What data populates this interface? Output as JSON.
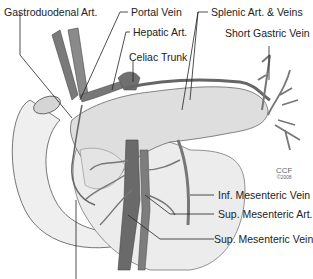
{
  "diagram": {
    "type": "anatomical-illustration",
    "labels": [
      {
        "id": "gastroduodenal-art",
        "text": "Gastroduodenal Art."
      },
      {
        "id": "portal-vein",
        "text": "Portal Vein"
      },
      {
        "id": "hepatic-art",
        "text": "Hepatic Art."
      },
      {
        "id": "celiac-trunk",
        "text": "Celiac Trunk"
      },
      {
        "id": "splenic-art-veins",
        "text": "Splenic Art. & Veins"
      },
      {
        "id": "short-gastric-vein",
        "text": "Short Gastric Vein"
      },
      {
        "id": "inf-mesenteric-vein",
        "text": "Inf. Mesenteric Vein"
      },
      {
        "id": "sup-mesenteric-art",
        "text": "Sup. Mesenteric Art."
      },
      {
        "id": "sup-mesenteric-vein",
        "text": "Sup. Mesenteric Vein"
      }
    ],
    "credit": {
      "org": "CCF",
      "year": "©2008"
    }
  },
  "colors": {
    "vessel": "#6e6e6e",
    "vessel_dark": "#4a4a4a",
    "organ_fill": "#ececec",
    "pancreas_fill": "#dcdcdc",
    "line": "#222222"
  }
}
